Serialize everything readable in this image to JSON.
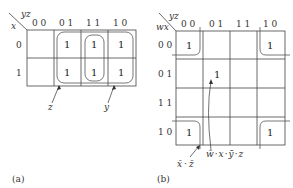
{
  "map_a": {
    "caption": "(a)",
    "row_var": "x",
    "col_var": "yz",
    "col_labels": [
      "0 0",
      "0 1",
      "1 1",
      "1 0"
    ],
    "row_labels": [
      "0",
      "1"
    ],
    "cells": [
      [
        "",
        "1",
        "1",
        "1"
      ],
      [
        "",
        "1",
        "1",
        "1"
      ]
    ],
    "groups": [
      {
        "label": "z",
        "cells": "columns 01,11"
      },
      {
        "label": "y",
        "cells": "columns 11,10"
      }
    ]
  },
  "map_b": {
    "caption": "(b)",
    "row_var": "wx",
    "col_var": "yz",
    "col_labels": [
      "0 0",
      "0 1",
      "1 1",
      "1 0"
    ],
    "row_labels": [
      "0 0",
      "0 1",
      "1 1",
      "1 0"
    ],
    "cells": [
      [
        "1",
        "",
        "",
        "1"
      ],
      [
        "",
        "1",
        "",
        ""
      ],
      [
        "",
        "",
        "",
        ""
      ],
      [
        "1",
        "",
        "",
        "1"
      ]
    ],
    "groups": [
      {
        "label_terms": [
          "x̄",
          "·",
          "z̄"
        ],
        "cells": "four corners"
      },
      {
        "label_terms": [
          "w̄",
          "·",
          "x",
          "·",
          "ȳ",
          "·",
          "z"
        ],
        "cells": "row 01, col 01"
      }
    ]
  }
}
